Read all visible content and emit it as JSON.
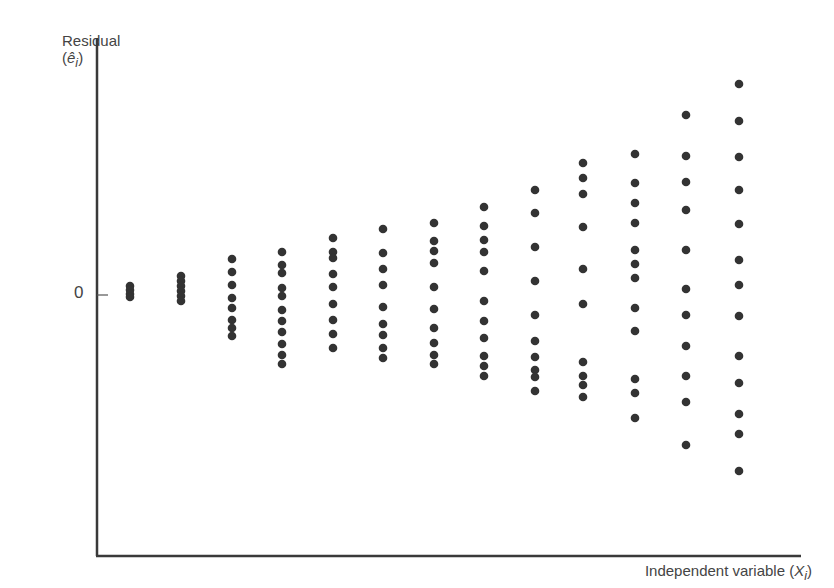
{
  "chart_data": {
    "type": "scatter",
    "title": "",
    "xlabel": "Independent variable (X_i)",
    "ylabel": "Residual (ê_i)",
    "y_ticks": [
      {
        "value": 0,
        "label": "0"
      }
    ],
    "x_ticks": [],
    "grid": false,
    "legend": null,
    "ylim": [
      -1.0,
      1.0
    ],
    "pixel_mapping": {
      "zero_y": 295,
      "unit_px": 260
    },
    "series": [
      {
        "name": "residuals",
        "columns": [
          {
            "x": 1,
            "px": 130,
            "y_px": [
              286,
              290,
              294,
              297
            ]
          },
          {
            "x": 2,
            "px": 181,
            "y_px": [
              276,
              281,
              286,
              291,
              296,
              301
            ]
          },
          {
            "x": 3,
            "px": 232,
            "y_px": [
              259,
              272,
              285,
              298,
              308,
              320,
              328,
              336
            ]
          },
          {
            "x": 4,
            "px": 282,
            "y_px": [
              252,
              265,
              273,
              288,
              296,
              310,
              321,
              332,
              344,
              355,
              364
            ]
          },
          {
            "x": 5,
            "px": 333,
            "y_px": [
              238,
              252,
              258,
              274,
              287,
              304,
              320,
              334,
              348
            ]
          },
          {
            "x": 6,
            "px": 383,
            "y_px": [
              229,
              253,
              269,
              285,
              307,
              324,
              335,
              348,
              358
            ]
          },
          {
            "x": 7,
            "px": 434,
            "y_px": [
              223,
              241,
              251,
              263,
              287,
              309,
              328,
              343,
              355,
              364
            ]
          },
          {
            "x": 8,
            "px": 484,
            "y_px": [
              207,
              226,
              240,
              252,
              271,
              301,
              321,
              338,
              356,
              366,
              376
            ]
          },
          {
            "x": 9,
            "px": 535,
            "y_px": [
              190,
              213,
              247,
              281,
              315,
              341,
              357,
              370,
              377,
              391
            ]
          },
          {
            "x": 10,
            "px": 583,
            "y_px": [
              163,
              178,
              194,
              227,
              269,
              304,
              362,
              376,
              385,
              397
            ]
          },
          {
            "x": 11,
            "px": 635,
            "y_px": [
              154,
              183,
              203,
              223,
              250,
              264,
              278,
              308,
              331,
              379,
              393,
              418
            ]
          },
          {
            "x": 12,
            "px": 686,
            "y_px": [
              115,
              156,
              182,
              210,
              250,
              289,
              315,
              346,
              376,
              402,
              445
            ]
          },
          {
            "x": 13,
            "px": 739,
            "y_px": [
              84,
              121,
              157,
              190,
              224,
              260,
              285,
              316,
              356,
              383,
              414,
              434,
              471
            ]
          }
        ]
      }
    ]
  },
  "labels": {
    "y_axis_line1": "Residual",
    "y_axis_line2_open": "(",
    "y_axis_symbol": "ê",
    "y_axis_sub": "i",
    "y_axis_line2_close": ")",
    "x_axis_text": "Independent variable (",
    "x_axis_symbol": "X",
    "x_axis_sub": "i",
    "x_axis_close": ")",
    "zero_tick": "0"
  },
  "colors": {
    "axis": "#3a3a3a",
    "dot": "#333333",
    "text": "#444444"
  }
}
